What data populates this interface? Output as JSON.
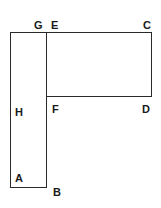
{
  "diagram": {
    "type": "geometry-figure",
    "stroke_color": "#2a2a2a",
    "labels": {
      "G": "G",
      "E": "E",
      "C": "C",
      "H": "H",
      "F": "F",
      "D": "D",
      "A": "A",
      "B": "B"
    },
    "shapes": [
      {
        "name": "tall-rectangle",
        "vertices": [
          "G",
          "E",
          "B",
          "A"
        ]
      },
      {
        "name": "wide-rectangle",
        "vertices": [
          "E",
          "C",
          "D",
          "F"
        ]
      }
    ]
  }
}
